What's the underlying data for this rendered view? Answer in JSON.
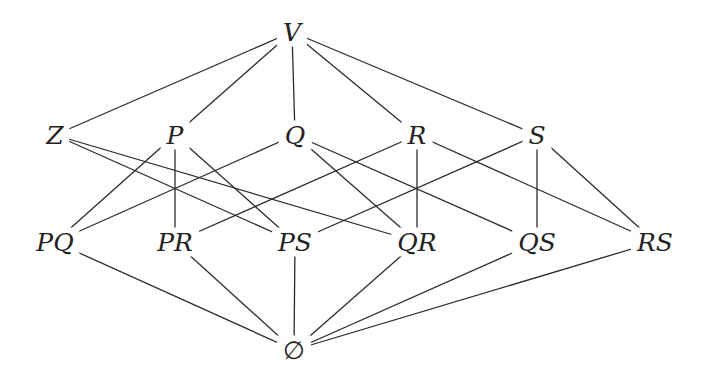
{
  "diagram": {
    "type": "hasse-diagram",
    "colors": {
      "line": "#2b2b2b",
      "text": "#222222",
      "background": "#ffffff"
    },
    "nodes": [
      {
        "id": "V",
        "label": "V",
        "x": 292,
        "y": 32
      },
      {
        "id": "Z",
        "label": "Z",
        "x": 55,
        "y": 135
      },
      {
        "id": "P",
        "label": "P",
        "x": 175,
        "y": 135
      },
      {
        "id": "Q",
        "label": "Q",
        "x": 295,
        "y": 135
      },
      {
        "id": "R",
        "label": "R",
        "x": 417,
        "y": 135
      },
      {
        "id": "S",
        "label": "S",
        "x": 537,
        "y": 135
      },
      {
        "id": "PQ",
        "label": "PQ",
        "x": 55,
        "y": 242
      },
      {
        "id": "PR",
        "label": "PR",
        "x": 175,
        "y": 242
      },
      {
        "id": "PS",
        "label": "PS",
        "x": 295,
        "y": 242
      },
      {
        "id": "QR",
        "label": "QR",
        "x": 417,
        "y": 242
      },
      {
        "id": "QS",
        "label": "QS",
        "x": 537,
        "y": 242
      },
      {
        "id": "RS",
        "label": "RS",
        "x": 655,
        "y": 242
      },
      {
        "id": "E",
        "label": "∅",
        "x": 294,
        "y": 350
      }
    ],
    "edges": [
      [
        "V",
        "Z"
      ],
      [
        "V",
        "P"
      ],
      [
        "V",
        "Q"
      ],
      [
        "V",
        "R"
      ],
      [
        "V",
        "S"
      ],
      [
        "Z",
        "PS"
      ],
      [
        "Z",
        "QR"
      ],
      [
        "P",
        "PQ"
      ],
      [
        "P",
        "PR"
      ],
      [
        "P",
        "PS"
      ],
      [
        "Q",
        "PQ"
      ],
      [
        "Q",
        "QR"
      ],
      [
        "Q",
        "QS"
      ],
      [
        "R",
        "PR"
      ],
      [
        "R",
        "QR"
      ],
      [
        "R",
        "RS"
      ],
      [
        "S",
        "PS"
      ],
      [
        "S",
        "QS"
      ],
      [
        "S",
        "RS"
      ],
      [
        "PQ",
        "E"
      ],
      [
        "PR",
        "E"
      ],
      [
        "PS",
        "E"
      ],
      [
        "QR",
        "E"
      ],
      [
        "QS",
        "E"
      ],
      [
        "RS",
        "E"
      ]
    ]
  }
}
